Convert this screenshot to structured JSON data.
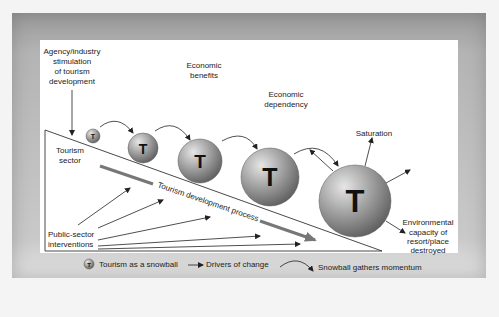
{
  "labels": {
    "agency": [
      "Agency/industry",
      "stimulation",
      "of tourism",
      "development"
    ],
    "economic_benefits": [
      "Economic",
      "benefits"
    ],
    "economic_dependency": [
      "Economic",
      "dependency"
    ],
    "saturation": "Saturation",
    "tourism_sector": [
      "Tourism",
      "sector"
    ],
    "process": "Tourism development process",
    "public_sector": [
      "Public-sector",
      "interventions"
    ],
    "environmental": [
      "Environmental",
      "capacity of",
      "resort/place",
      "destroyed"
    ]
  },
  "ball_letter": "T",
  "legend": {
    "snowball": "Tourism as a snowball",
    "drivers": "Drivers of change",
    "momentum": "Snowball gathers momentum"
  },
  "colors": {
    "ball_light": "#d8d8d8",
    "ball_dark": "#6e6e6e",
    "process_arrow": "#777777",
    "line": "#333333"
  }
}
